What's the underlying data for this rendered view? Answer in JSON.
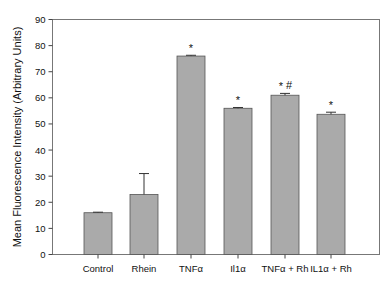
{
  "chart_data": {
    "type": "bar",
    "title": "",
    "xlabel": "",
    "ylabel": "Mean Fluorescence Intensity (Arbitrary Units)",
    "ylim": [
      0,
      90
    ],
    "yticks": [
      0,
      10,
      20,
      30,
      40,
      50,
      60,
      70,
      80,
      90
    ],
    "grid": false,
    "legend": null,
    "categories": [
      "Control",
      "Rhein",
      "TNFα",
      "Il1α",
      "TNFα + Rh",
      "IL1α + Rh"
    ],
    "values": [
      16,
      23,
      76,
      56,
      61,
      53.7
    ],
    "error": [
      0.2,
      8,
      0.3,
      0.3,
      0.7,
      0.8
    ],
    "annotations": [
      "",
      "",
      "*",
      "*",
      "*#",
      "*"
    ],
    "bar_color": "#aaaaaa",
    "bar_edge_color": "#555555",
    "axis_color": "#444444"
  }
}
